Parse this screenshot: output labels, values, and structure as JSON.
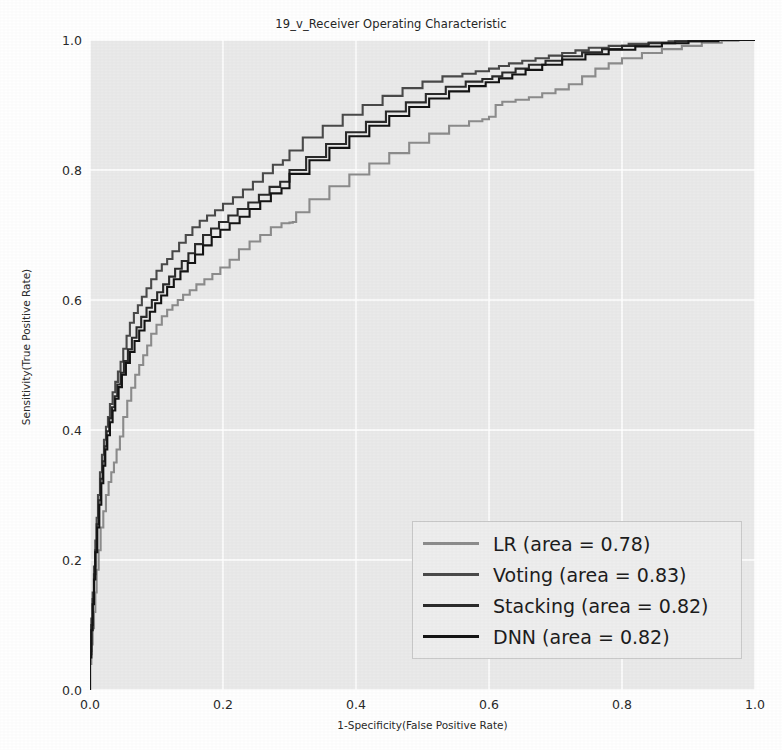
{
  "chart_data": {
    "type": "line",
    "title": "19_v_Receiver Operating Characteristic",
    "xlabel": "1-Specificity(False Positive Rate)",
    "ylabel": "Sensitivity(True Positive Rate)",
    "xlim": [
      0.0,
      1.0
    ],
    "ylim": [
      0.0,
      1.0
    ],
    "grid": true,
    "legend_position": "lower right",
    "xticks": [
      "0.0",
      "0.2",
      "0.4",
      "0.6",
      "0.8",
      "1.0"
    ],
    "xtick_values": [
      0.0,
      0.2,
      0.4,
      0.6,
      0.8,
      1.0
    ],
    "yticks": [
      "0.0",
      "0.2",
      "0.4",
      "0.6",
      "0.8",
      "1.0"
    ],
    "ytick_values": [
      0.0,
      0.2,
      0.4,
      0.6,
      0.8,
      1.0
    ],
    "series": [
      {
        "name": "LR",
        "area": 0.78,
        "legend_label": "LR (area = 0.78)",
        "color": "#8c8c8c",
        "x": [
          0.0,
          0.002,
          0.004,
          0.006,
          0.008,
          0.01,
          0.013,
          0.016,
          0.02,
          0.024,
          0.028,
          0.032,
          0.036,
          0.04,
          0.045,
          0.05,
          0.056,
          0.062,
          0.068,
          0.074,
          0.08,
          0.086,
          0.092,
          0.1,
          0.108,
          0.116,
          0.124,
          0.132,
          0.14,
          0.15,
          0.16,
          0.172,
          0.184,
          0.196,
          0.21,
          0.224,
          0.24,
          0.256,
          0.272,
          0.288,
          0.3,
          0.305,
          0.31,
          0.33,
          0.36,
          0.39,
          0.42,
          0.45,
          0.48,
          0.51,
          0.54,
          0.57,
          0.59,
          0.6,
          0.61,
          0.62,
          0.64,
          0.66,
          0.68,
          0.7,
          0.72,
          0.74,
          0.76,
          0.78,
          0.8,
          0.83,
          0.86,
          0.89,
          0.92,
          0.95,
          0.975,
          1.0
        ],
        "y": [
          0.0,
          0.04,
          0.07,
          0.095,
          0.12,
          0.15,
          0.185,
          0.215,
          0.25,
          0.275,
          0.3,
          0.32,
          0.335,
          0.35,
          0.37,
          0.39,
          0.42,
          0.445,
          0.465,
          0.485,
          0.5,
          0.515,
          0.53,
          0.548,
          0.562,
          0.575,
          0.585,
          0.592,
          0.6,
          0.608,
          0.615,
          0.624,
          0.632,
          0.64,
          0.65,
          0.662,
          0.678,
          0.69,
          0.7,
          0.712,
          0.718,
          0.719,
          0.72,
          0.735,
          0.755,
          0.775,
          0.793,
          0.81,
          0.826,
          0.842,
          0.856,
          0.868,
          0.875,
          0.878,
          0.882,
          0.9,
          0.905,
          0.908,
          0.912,
          0.918,
          0.924,
          0.932,
          0.944,
          0.956,
          0.964,
          0.972,
          0.98,
          0.986,
          0.991,
          0.996,
          0.999,
          1.0
        ]
      },
      {
        "name": "Voting",
        "area": 0.83,
        "legend_label": "Voting (area = 0.83)",
        "color": "#4a4a4a",
        "x": [
          0.0,
          0.002,
          0.004,
          0.006,
          0.008,
          0.01,
          0.012,
          0.015,
          0.018,
          0.021,
          0.024,
          0.027,
          0.03,
          0.034,
          0.038,
          0.042,
          0.046,
          0.05,
          0.055,
          0.06,
          0.066,
          0.072,
          0.078,
          0.085,
          0.092,
          0.1,
          0.108,
          0.116,
          0.124,
          0.134,
          0.144,
          0.154,
          0.165,
          0.176,
          0.188,
          0.2,
          0.215,
          0.23,
          0.245,
          0.26,
          0.275,
          0.29,
          0.3,
          0.32,
          0.35,
          0.38,
          0.41,
          0.44,
          0.47,
          0.5,
          0.53,
          0.56,
          0.58,
          0.6,
          0.615,
          0.63,
          0.65,
          0.67,
          0.69,
          0.71,
          0.73,
          0.75,
          0.78,
          0.81,
          0.84,
          0.87,
          0.9,
          0.93,
          0.96,
          1.0
        ],
        "y": [
          0.0,
          0.06,
          0.11,
          0.15,
          0.19,
          0.23,
          0.265,
          0.3,
          0.335,
          0.362,
          0.385,
          0.405,
          0.42,
          0.44,
          0.458,
          0.474,
          0.49,
          0.505,
          0.525,
          0.545,
          0.565,
          0.58,
          0.592,
          0.605,
          0.618,
          0.632,
          0.645,
          0.655,
          0.663,
          0.675,
          0.688,
          0.7,
          0.712,
          0.722,
          0.73,
          0.738,
          0.748,
          0.758,
          0.77,
          0.782,
          0.795,
          0.808,
          0.815,
          0.83,
          0.85,
          0.868,
          0.885,
          0.9,
          0.914,
          0.926,
          0.936,
          0.944,
          0.948,
          0.952,
          0.956,
          0.96,
          0.964,
          0.968,
          0.972,
          0.976,
          0.98,
          0.984,
          0.988,
          0.991,
          0.994,
          0.996,
          0.998,
          0.999,
          1.0,
          1.0
        ]
      },
      {
        "name": "Stacking",
        "area": 0.82,
        "legend_label": "Stacking (area = 0.82)",
        "color": "#2b2b2b",
        "x": [
          0.0,
          0.002,
          0.004,
          0.006,
          0.008,
          0.01,
          0.013,
          0.016,
          0.019,
          0.022,
          0.025,
          0.029,
          0.033,
          0.037,
          0.041,
          0.046,
          0.051,
          0.057,
          0.063,
          0.07,
          0.077,
          0.085,
          0.093,
          0.101,
          0.11,
          0.119,
          0.128,
          0.138,
          0.148,
          0.158,
          0.17,
          0.182,
          0.194,
          0.208,
          0.222,
          0.238,
          0.254,
          0.27,
          0.286,
          0.3,
          0.325,
          0.355,
          0.385,
          0.415,
          0.445,
          0.475,
          0.505,
          0.535,
          0.565,
          0.59,
          0.605,
          0.62,
          0.64,
          0.66,
          0.685,
          0.71,
          0.74,
          0.77,
          0.8,
          0.84,
          0.88,
          0.92,
          0.96,
          1.0
        ],
        "y": [
          0.0,
          0.055,
          0.1,
          0.14,
          0.178,
          0.215,
          0.255,
          0.292,
          0.325,
          0.352,
          0.375,
          0.398,
          0.418,
          0.435,
          0.452,
          0.47,
          0.488,
          0.506,
          0.524,
          0.542,
          0.558,
          0.574,
          0.588,
          0.6,
          0.612,
          0.624,
          0.636,
          0.648,
          0.66,
          0.672,
          0.686,
          0.7,
          0.71,
          0.72,
          0.73,
          0.74,
          0.75,
          0.762,
          0.774,
          0.782,
          0.8,
          0.82,
          0.84,
          0.858,
          0.874,
          0.89,
          0.904,
          0.917,
          0.928,
          0.936,
          0.94,
          0.944,
          0.95,
          0.956,
          0.962,
          0.968,
          0.975,
          0.981,
          0.986,
          0.991,
          0.995,
          0.998,
          1.0,
          1.0
        ]
      },
      {
        "name": "DNN",
        "area": 0.82,
        "legend_label": "DNN (area = 0.82)",
        "color": "#141414",
        "x": [
          0.0,
          0.002,
          0.004,
          0.006,
          0.008,
          0.011,
          0.014,
          0.017,
          0.02,
          0.023,
          0.026,
          0.03,
          0.034,
          0.038,
          0.043,
          0.048,
          0.054,
          0.06,
          0.067,
          0.074,
          0.082,
          0.09,
          0.098,
          0.107,
          0.116,
          0.126,
          0.136,
          0.147,
          0.158,
          0.17,
          0.183,
          0.196,
          0.21,
          0.225,
          0.24,
          0.256,
          0.272,
          0.288,
          0.3,
          0.33,
          0.36,
          0.39,
          0.42,
          0.45,
          0.48,
          0.51,
          0.54,
          0.57,
          0.595,
          0.615,
          0.635,
          0.655,
          0.68,
          0.71,
          0.745,
          0.78,
          0.82,
          0.86,
          0.9,
          0.945,
          1.0
        ],
        "y": [
          0.0,
          0.05,
          0.092,
          0.132,
          0.17,
          0.212,
          0.25,
          0.285,
          0.318,
          0.345,
          0.37,
          0.392,
          0.412,
          0.43,
          0.448,
          0.466,
          0.485,
          0.503,
          0.52,
          0.537,
          0.553,
          0.568,
          0.582,
          0.595,
          0.607,
          0.62,
          0.632,
          0.644,
          0.657,
          0.67,
          0.684,
          0.697,
          0.708,
          0.718,
          0.728,
          0.74,
          0.752,
          0.764,
          0.772,
          0.794,
          0.815,
          0.834,
          0.852,
          0.868,
          0.883,
          0.897,
          0.91,
          0.921,
          0.929,
          0.935,
          0.941,
          0.947,
          0.954,
          0.962,
          0.97,
          0.978,
          0.985,
          0.99,
          0.995,
          0.998,
          1.0
        ]
      }
    ]
  },
  "figure": {
    "background_color": "#ffffff",
    "axes_background_color": "#eaeaea",
    "grid_color": "#ffffff"
  }
}
